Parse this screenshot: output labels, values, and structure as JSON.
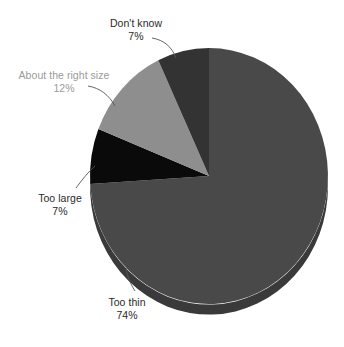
{
  "chart_data": {
    "type": "pie",
    "title": "",
    "subtitle": "",
    "legend_position": "outside-labels",
    "grid": false,
    "categories": [
      "Too thin",
      "Don't know",
      "About the right size",
      "Too large"
    ],
    "values": [
      74,
      7,
      12,
      7
    ],
    "value_suffix": "%",
    "slices": [
      {
        "label": "Too thin",
        "value": 74,
        "value_text": "74%",
        "color": "#494949",
        "side_color": "#3a3a3a",
        "label_color": "#2a2a2a"
      },
      {
        "label": "Don't know",
        "value": 7,
        "value_text": "7%",
        "color": "#333333",
        "side_color": "#262626",
        "label_color": "#2a2a2a"
      },
      {
        "label": "About the right size",
        "value": 12,
        "value_text": "12%",
        "color": "#8e8e8e",
        "side_color": "#6f6f6f",
        "label_color": "#9a9a9a"
      },
      {
        "label": "Too large",
        "value": 7,
        "value_text": "7%",
        "color": "#0a0a0a",
        "side_color": "#070707",
        "label_color": "#2a2a2a"
      }
    ],
    "background_color": "#ffffff",
    "leader_line_color": "#555555"
  },
  "labels": {
    "dont_know": {
      "name": "Don't know",
      "value": "7%"
    },
    "right_size": {
      "name": "About the right size",
      "value": "12%"
    },
    "too_large": {
      "name": "Too large",
      "value": "7%"
    },
    "too_thin": {
      "name": "Too thin",
      "value": "74%"
    }
  }
}
